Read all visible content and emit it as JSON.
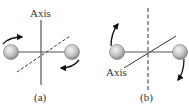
{
  "panels": [
    {
      "id": "a",
      "caption": "(a)",
      "axis_label": "Axis"
    },
    {
      "id": "b",
      "caption": "(b)",
      "axis_label": "Axis"
    }
  ],
  "colors": {
    "sphere": "#c8c8c8",
    "line": "#333333",
    "arrow": "#111111"
  }
}
